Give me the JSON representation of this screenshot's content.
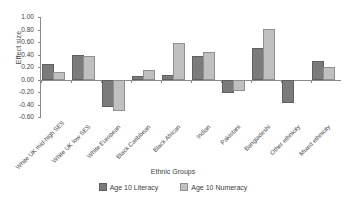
{
  "chart_data": {
    "type": "bar",
    "title": "",
    "xlabel": "Ethnic Groups",
    "ylabel": "Effect size",
    "ylim": [
      -0.6,
      1.0
    ],
    "ytick_step": 0.2,
    "grid": false,
    "legend_position": "bottom",
    "yticks": [
      "1.00",
      "0.80",
      "0.60",
      "0.40",
      "0.20",
      "0.00",
      "-0.20",
      "-0.40",
      "-0.60"
    ],
    "categories": [
      "White UK mid-high SES",
      "White UK low SES",
      "White European",
      "Black Caribbean",
      "Black African",
      "Indian",
      "Pakistani",
      "Bangladeshi",
      "Other ethnicity",
      "Mixed ethnicity"
    ],
    "series": [
      {
        "name": "Age 10 Literacy",
        "color": "#7b7b7b",
        "values": [
          0.25,
          0.39,
          -0.44,
          0.06,
          0.08,
          0.37,
          -0.21,
          0.5,
          -0.37,
          0.29
        ]
      },
      {
        "name": "Age 10 Numeracy",
        "color": "#c0c0c0",
        "values": [
          0.12,
          0.38,
          -0.5,
          0.15,
          0.58,
          0.44,
          -0.19,
          0.81,
          0.0,
          0.2
        ]
      }
    ]
  },
  "legend": {
    "items": [
      {
        "label": "Age 10 Literacy"
      },
      {
        "label": "Age 10 Numeracy"
      }
    ]
  }
}
